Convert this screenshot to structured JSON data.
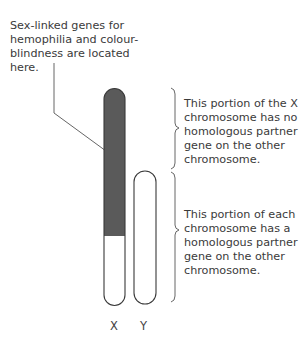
{
  "annotations": {
    "sex_linked_genes": "Sex-linked genes for hemophilia and colour-blindness are located here.",
    "non_homologous_portion": "This portion of the X chromosome has no homologous partner gene on the other chromosome.",
    "homologous_portion": "This portion of each chromosome has a homologous partner gene on the other chromosome."
  },
  "chromosomes": [
    {
      "label": "X",
      "dark_fill": "#5a5a5a",
      "light_fill": "#ffffff"
    },
    {
      "label": "Y",
      "fill": "#ffffff"
    }
  ],
  "colors": {
    "outline": "#3a3a3a",
    "dark_region": "#5a5a5a",
    "text": "#3a3a3a"
  }
}
